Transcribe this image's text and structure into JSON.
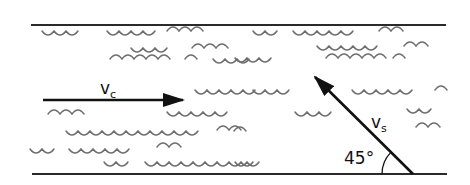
{
  "diagram": {
    "colors": {
      "background": "#ffffff",
      "bank_line": "#2a2a2a",
      "wave": "#6e6e6e",
      "vector": "#111111"
    },
    "banks": {
      "top": {
        "x1": 31,
        "x2": 446,
        "y": 25
      },
      "bottom": {
        "x1": 32,
        "x2": 447,
        "y": 174
      }
    },
    "vectors": [
      {
        "id": "current",
        "symbol": "v",
        "subscript": "c",
        "from": [
          43,
          100
        ],
        "to": [
          183,
          100
        ],
        "label_pos": [
          100,
          94
        ]
      },
      {
        "id": "swimmer",
        "symbol": "v",
        "subscript": "s",
        "from": [
          413,
          174
        ],
        "to": [
          315,
          77
        ],
        "label_pos": [
          371,
          128
        ]
      }
    ],
    "angle": {
      "text": "45°",
      "vertex": [
        413,
        174
      ],
      "radius": 31,
      "label_pos": [
        344,
        164
      ]
    },
    "waves": [
      {
        "x": 42,
        "y": 31,
        "n": 3,
        "type": "cup"
      },
      {
        "x": 107,
        "y": 31,
        "n": 4,
        "type": "cup"
      },
      {
        "x": 167,
        "y": 31,
        "n": 3,
        "type": "cap"
      },
      {
        "x": 253,
        "y": 31,
        "n": 2,
        "type": "cup"
      },
      {
        "x": 293,
        "y": 31,
        "n": 5,
        "type": "cup"
      },
      {
        "x": 379,
        "y": 31,
        "n": 2,
        "type": "cap"
      },
      {
        "x": 131,
        "y": 48,
        "n": 3,
        "type": "cup"
      },
      {
        "x": 192,
        "y": 48,
        "n": 3,
        "type": "cap"
      },
      {
        "x": 317,
        "y": 46,
        "n": 5,
        "type": "cup"
      },
      {
        "x": 404,
        "y": 46,
        "n": 2,
        "type": "cap"
      },
      {
        "x": 110,
        "y": 59,
        "n": 5,
        "type": "cap"
      },
      {
        "x": 185,
        "y": 59,
        "n": 1,
        "type": "cap"
      },
      {
        "x": 213,
        "y": 59,
        "n": 3,
        "type": "cup"
      },
      {
        "x": 235,
        "y": 58,
        "n": 3,
        "type": "cup"
      },
      {
        "x": 326,
        "y": 58,
        "n": 5,
        "type": "cap"
      },
      {
        "x": 393,
        "y": 58,
        "n": 1,
        "type": "cap"
      },
      {
        "x": 195,
        "y": 90,
        "n": 5,
        "type": "cup"
      },
      {
        "x": 253,
        "y": 90,
        "n": 3,
        "type": "cup"
      },
      {
        "x": 352,
        "y": 90,
        "n": 5,
        "type": "cup"
      },
      {
        "x": 435,
        "y": 90,
        "n": 1,
        "type": "cap"
      },
      {
        "x": 48,
        "y": 114,
        "n": 3,
        "type": "cap"
      },
      {
        "x": 167,
        "y": 112,
        "n": 5,
        "type": "cup"
      },
      {
        "x": 295,
        "y": 112,
        "n": 3,
        "type": "cup"
      },
      {
        "x": 407,
        "y": 109,
        "n": 2,
        "type": "cup"
      },
      {
        "x": 66,
        "y": 131,
        "n": 11,
        "type": "cup"
      },
      {
        "x": 217,
        "y": 130,
        "n": 2,
        "type": "cap"
      },
      {
        "x": 234,
        "y": 131,
        "n": 1,
        "type": "cap"
      },
      {
        "x": 416,
        "y": 127,
        "n": 2,
        "type": "cap"
      },
      {
        "x": 30,
        "y": 149,
        "n": 2,
        "type": "cup"
      },
      {
        "x": 69,
        "y": 149,
        "n": 5,
        "type": "cup"
      },
      {
        "x": 157,
        "y": 147,
        "n": 2,
        "type": "cap"
      },
      {
        "x": 235,
        "y": 162,
        "n": 2,
        "type": "cup"
      },
      {
        "x": 104,
        "y": 162,
        "n": 2,
        "type": "cup"
      },
      {
        "x": 145,
        "y": 162,
        "n": 9,
        "type": "cup"
      }
    ]
  }
}
